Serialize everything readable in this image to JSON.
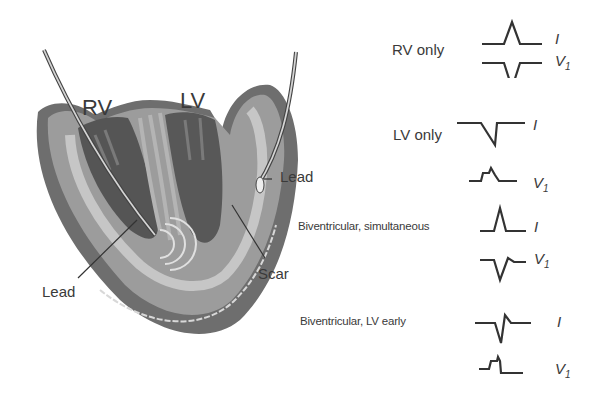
{
  "figure": {
    "heart_labels": {
      "rv": "RV",
      "lv": "LV",
      "lead_right": "Lead",
      "lead_left": "Lead",
      "scar": "Scar"
    },
    "panels": [
      {
        "title": "RV only",
        "lead1": "I",
        "lead2": "V",
        "lead2_sub": "1"
      },
      {
        "title": "LV only",
        "lead1": "I",
        "lead2": "V",
        "lead2_sub": "1"
      },
      {
        "title": "Biventricular, simultaneous",
        "lead1": "I",
        "lead2": "V",
        "lead2_sub": "1"
      },
      {
        "title": "Biventricular, LV early",
        "lead1": "I",
        "lead2": "V",
        "lead2_sub": "1"
      }
    ],
    "colors": {
      "ink": "#3a3a3a",
      "tissue_dark": "#6e6e6e",
      "tissue_mid": "#9a9a9a",
      "tissue_light": "#c4c4c4"
    }
  }
}
